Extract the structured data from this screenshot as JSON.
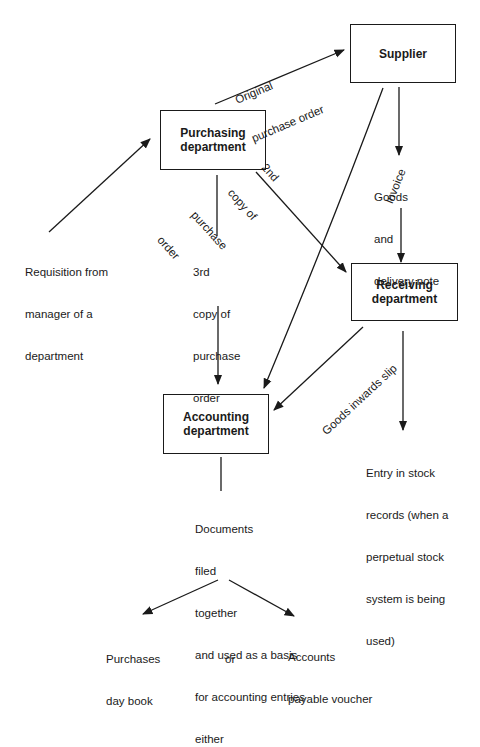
{
  "diagram": {
    "type": "flowchart",
    "title": "",
    "nodes": [
      {
        "id": "supplier",
        "line1": "Supplier",
        "line2": ""
      },
      {
        "id": "purchasing",
        "line1": "Purchasing",
        "line2": "department"
      },
      {
        "id": "receiving",
        "line1": "Receiving",
        "line2": "department"
      },
      {
        "id": "accounting",
        "line1": "Accounting",
        "line2": "department"
      }
    ],
    "edges": [
      {
        "from": "requisition",
        "to": "purchasing",
        "label": ""
      },
      {
        "from": "purchasing",
        "to": "supplier",
        "label": "Original purchase order"
      },
      {
        "from": "purchasing",
        "to": "receiving",
        "label": "2nd copy of purchase order"
      },
      {
        "from": "purchasing",
        "to": "accounting",
        "label": "3rd copy of purchase order"
      },
      {
        "from": "supplier",
        "to": "receiving",
        "label": "Goods and delivery note"
      },
      {
        "from": "supplier",
        "to": "accounting",
        "label": "Invoice"
      },
      {
        "from": "receiving",
        "to": "accounting",
        "label": "Goods inwards slip"
      },
      {
        "from": "receiving",
        "to": "stock_entry",
        "label": ""
      },
      {
        "from": "accounting",
        "to": "documents_filed",
        "label": ""
      },
      {
        "from": "documents_filed",
        "to": "purchases_day_book",
        "label": ""
      },
      {
        "from": "documents_filed",
        "to": "accounts_payable_voucher",
        "label": ""
      }
    ],
    "labels": {
      "original_po": [
        "Original",
        "purchase order"
      ],
      "second_copy": [
        "2nd",
        "copy of",
        "purchase",
        "order"
      ],
      "third_copy": [
        "3rd",
        "copy of",
        "purchase",
        "order"
      ],
      "invoice": "Invoice",
      "goods_delivery": [
        "Goods",
        "and",
        "delivery note"
      ],
      "goods_inwards_slip": "Goods inwards slip",
      "requisition": [
        "Requisition from",
        "manager of a",
        "department"
      ],
      "stock_entry": [
        "Entry in stock",
        "records (when a",
        "perpetual stock",
        "system is being",
        "used)"
      ],
      "documents_filed": [
        "Documents",
        "filed",
        "together",
        "and used as a basis",
        "for accounting entries",
        "either"
      ],
      "purchases_day_book": [
        "Purchases",
        "day book"
      ],
      "or": "or",
      "accounts_payable_voucher": [
        "Accounts",
        "payable voucher"
      ]
    }
  }
}
